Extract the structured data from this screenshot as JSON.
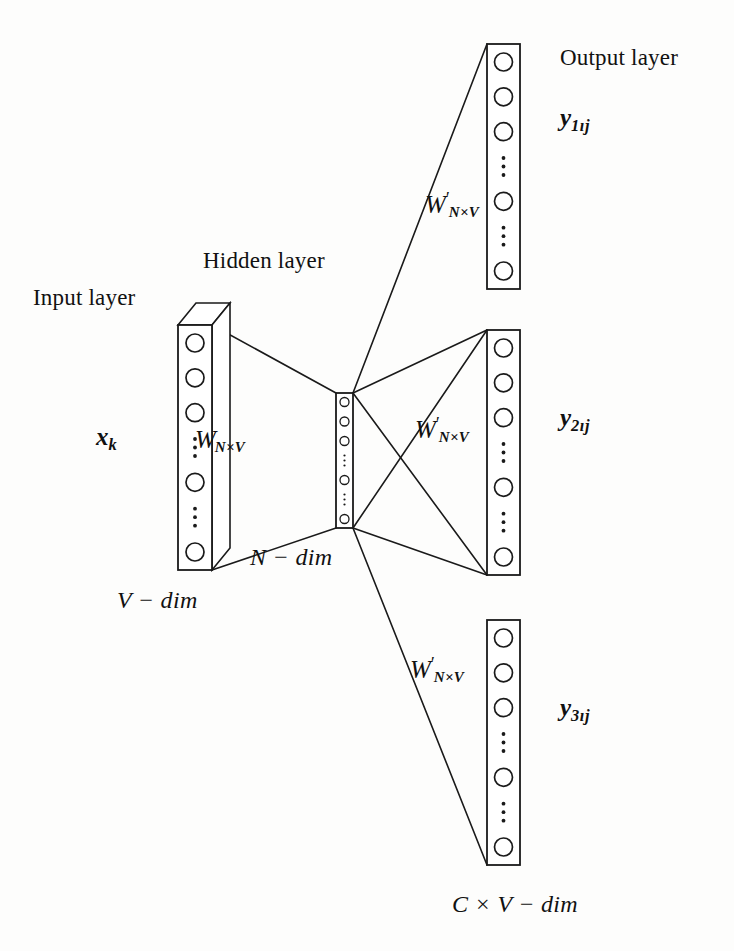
{
  "figure": {
    "kind": "neural-network-architecture-diagram",
    "background": "#fdfdfc",
    "stroke": "#1a1a1a"
  },
  "labels": {
    "input_layer": "Input layer",
    "hidden_layer": "Hidden layer",
    "output_layer": "Output layer"
  },
  "variables": {
    "input_vector": {
      "base": "x",
      "sub": "k"
    },
    "output_1": {
      "base": "y",
      "sub": "1ıj"
    },
    "output_2": {
      "base": "y",
      "sub": "2ıj"
    },
    "output_3": {
      "base": "y",
      "sub": "3ıj"
    }
  },
  "weights": {
    "input_to_hidden": {
      "base": "W",
      "prime": "",
      "sub": "N×V"
    },
    "hidden_to_output_1": {
      "base": "W",
      "prime": "′",
      "sub": "N×V"
    },
    "hidden_to_output_2": {
      "base": "W",
      "prime": "′",
      "sub": "N×V"
    },
    "hidden_to_output_3": {
      "base": "W",
      "prime": "′",
      "sub": "N×V"
    }
  },
  "dimensions": {
    "input": "V − dim",
    "hidden": "N − dim",
    "output": "C × V − dim"
  },
  "layers": {
    "input": {
      "name": "input-layer-column",
      "x": 178,
      "y": 325,
      "width": 34,
      "height": 245,
      "depth_dx": 18,
      "depth_dy": -22,
      "node_radius": 9,
      "pattern": [
        "node",
        "node",
        "node",
        "vdots",
        "node",
        "vdots",
        "node"
      ]
    },
    "hidden": {
      "name": "hidden-layer-column",
      "x": 336,
      "y": 393,
      "width": 17,
      "height": 135,
      "node_radius": 4.5,
      "pattern": [
        "node",
        "node",
        "node",
        "vdots",
        "node",
        "vdots",
        "node"
      ]
    },
    "outputs": [
      {
        "name": "output-layer-column-1",
        "x": 487,
        "y": 44,
        "width": 33,
        "height": 245,
        "node_radius": 9,
        "pattern": [
          "node",
          "node",
          "node",
          "vdots",
          "node",
          "vdots",
          "node"
        ]
      },
      {
        "name": "output-layer-column-2",
        "x": 487,
        "y": 330,
        "width": 33,
        "height": 245,
        "node_radius": 9,
        "pattern": [
          "node",
          "node",
          "node",
          "vdots",
          "node",
          "vdots",
          "node"
        ]
      },
      {
        "name": "output-layer-column-3",
        "x": 487,
        "y": 620,
        "width": 33,
        "height": 245,
        "node_radius": 9,
        "pattern": [
          "node",
          "node",
          "node",
          "vdots",
          "node",
          "vdots",
          "node"
        ]
      }
    ]
  },
  "connections": {
    "input_to_hidden": [
      {
        "from": [
          212,
          325
        ],
        "to": [
          336,
          393
        ]
      },
      {
        "from": [
          212,
          570
        ],
        "to": [
          336,
          528
        ]
      }
    ],
    "hidden_to_outputs": [
      {
        "from": [
          353,
          393
        ],
        "to": [
          487,
          44
        ]
      },
      {
        "from": [
          353,
          393
        ],
        "to": [
          487,
          330
        ]
      },
      {
        "from": [
          353,
          393
        ],
        "to": [
          487,
          575
        ]
      },
      {
        "from": [
          353,
          528
        ],
        "to": [
          487,
          330
        ]
      },
      {
        "from": [
          353,
          528
        ],
        "to": [
          487,
          575
        ]
      },
      {
        "from": [
          353,
          528
        ],
        "to": [
          487,
          865
        ]
      }
    ]
  },
  "label_positions": {
    "input_layer": [
      33,
      286
    ],
    "hidden_layer": [
      203,
      249
    ],
    "output_layer": [
      560,
      46
    ],
    "input_vector": [
      96,
      424
    ],
    "weight_in": [
      195,
      425
    ],
    "weight_out_top": [
      425,
      190
    ],
    "weight_out_mid": [
      415,
      415
    ],
    "weight_out_bot": [
      410,
      655
    ],
    "output_1": [
      560,
      105
    ],
    "output_2": [
      560,
      405
    ],
    "output_3": [
      560,
      695
    ],
    "dim_input": [
      117,
      588
    ],
    "dim_hidden": [
      250,
      545
    ],
    "dim_output": [
      452,
      892
    ]
  }
}
